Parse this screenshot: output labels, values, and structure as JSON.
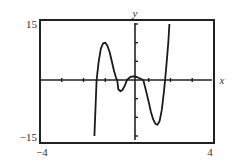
{
  "chart_data": {
    "type": "line",
    "title": "",
    "xlabel": "x",
    "ylabel": "y",
    "xlim": [
      -4,
      4
    ],
    "ylim": [
      -15,
      15
    ],
    "x_tick_labels": [
      "-4",
      "4"
    ],
    "y_tick_labels": [
      "-15",
      "15"
    ],
    "x_ticks": [
      -3,
      -2,
      -1,
      0,
      1,
      2,
      3
    ],
    "y_ticks": [
      -15,
      -10,
      -5,
      0,
      5,
      10,
      15
    ],
    "grid": false,
    "legend": null,
    "series": [
      {
        "name": "f(x)",
        "x": [
          -1.5,
          -1.4,
          -1.3,
          -1.2,
          -1.1,
          -1.0,
          -0.9,
          -0.8,
          -0.7,
          -0.6,
          -0.5,
          -0.45,
          -0.4,
          -0.3,
          -0.2,
          -0.1,
          0.0,
          0.1,
          0.2,
          0.3,
          0.45,
          0.6,
          0.75,
          0.9,
          1.0,
          1.1,
          1.2,
          1.3,
          1.4,
          1.5,
          1.6,
          1.7,
          1.75,
          1.8,
          1.9,
          1.95
        ],
        "y": [
          -15,
          0,
          5,
          8.5,
          9.8,
          10,
          9.2,
          7.5,
          5,
          2.5,
          0.5,
          0,
          -2.5,
          -3,
          -2.6,
          -1.5,
          0,
          0.6,
          0.9,
          1,
          0.8,
          0.4,
          0,
          -3.5,
          -6,
          -8.5,
          -10.5,
          -11.7,
          -12,
          -11,
          -8,
          -3,
          0,
          3,
          10,
          15
        ]
      }
    ]
  },
  "labels": {
    "y_max": "15",
    "y_min": "−15",
    "x_min": "−4",
    "x_max": "4",
    "x_axis": "x",
    "y_axis": "y"
  },
  "colors": {
    "frame": "#222222",
    "curve": "#1a1a1a",
    "text": "#333333",
    "background": "#ffffff"
  }
}
